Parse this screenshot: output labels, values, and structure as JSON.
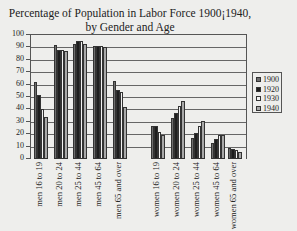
{
  "chart_data": {
    "type": "bar",
    "title": "Percentage of Population in Labor Force 1900¡1940,",
    "subtitle": "by Gender and Age",
    "xlabel": "",
    "ylabel": "",
    "ylim": [
      0,
      100
    ],
    "yticks": [
      "0",
      "10",
      "20",
      "30",
      "40",
      "50",
      "60",
      "70",
      "80",
      "90",
      "100"
    ],
    "grid": true,
    "legend_position": "right",
    "categories": [
      "men 16 to 19",
      "men 20 to 24",
      "men 25 to 44",
      "men 45 to 64",
      "men 65 and over",
      "women 16 to 19",
      "women 20 to 24",
      "women 25 to 44",
      "women 45 to 64",
      "women 65 and over"
    ],
    "series": [
      {
        "name": "1900",
        "color": "#6e6e6e",
        "values": [
          62,
          92,
          93,
          91,
          63,
          27,
          33,
          17,
          13,
          9
        ]
      },
      {
        "name": "1920",
        "color": "#1e1e1e",
        "values": [
          52,
          88,
          95,
          91,
          56,
          27,
          37,
          21,
          16,
          8
        ]
      },
      {
        "name": "1930",
        "color": "#f2f2f2",
        "values": [
          40,
          88,
          95,
          91,
          54,
          22,
          43,
          27,
          19,
          7
        ]
      },
      {
        "name": "1940",
        "color": "#a8a8a8",
        "values": [
          34,
          87,
          93,
          90,
          42,
          19,
          47,
          31,
          19,
          6
        ]
      }
    ]
  }
}
